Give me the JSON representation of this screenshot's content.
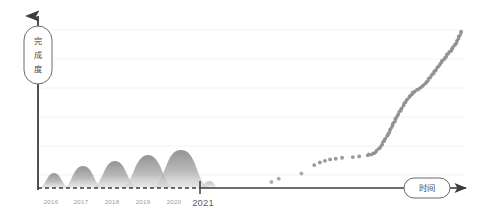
{
  "figure": {
    "background_color": "#ffffff",
    "axis_color": "#3d3d3d",
    "grid_color": "#f2f2f2",
    "hill_color": "#9a9a9a",
    "dot_color": "#8f8f8f",
    "tick_label_color": "#9b9b9b",
    "emph_label_color": "#5e5e5e"
  },
  "axes": {
    "y_axis_label": "完成度",
    "x_axis_label": "时间",
    "x_tick_labels": [
      "2016",
      "2017",
      "2018",
      "2019",
      "2020",
      "2021"
    ],
    "emphasized_tick": "2021",
    "y_tick_labels": [],
    "grid": "horizontal-faint",
    "legend": "none"
  },
  "chart_data": {
    "type": "scatter",
    "title": "",
    "xlabel": "时间",
    "ylabel": "完成度",
    "grid": true,
    "legend_position": "none",
    "xlim": [
      2015.6,
      2025.5
    ],
    "ylim": [
      0,
      1
    ],
    "x_tick_values": [
      2016,
      2017,
      2018,
      2019,
      2020,
      2021
    ],
    "x_tick_labels": [
      "2016",
      "2017",
      "2018",
      "2019",
      "2020",
      "2021"
    ],
    "series": [
      {
        "name": "年度周期峰 (hills)",
        "type": "area",
        "note": "five recurring annual bumps of increasing amplitude before 2021",
        "peaks_x": [
          2016.0,
          2016.95,
          2017.95,
          2018.95,
          2019.95
        ],
        "peaks_height_px": [
          12,
          18,
          23,
          30,
          36
        ],
        "baseline": "dashed"
      },
      {
        "name": "完成度进度点 (dots)",
        "type": "scatter",
        "note": "sparse dots just after 2021 becoming a dense rising trail",
        "points": [
          [
            2021.05,
            0.035
          ],
          [
            2021.22,
            0.055
          ],
          [
            2021.75,
            0.085
          ],
          [
            2022.05,
            0.135
          ],
          [
            2022.18,
            0.15
          ],
          [
            2022.3,
            0.16
          ],
          [
            2022.42,
            0.168
          ],
          [
            2022.55,
            0.172
          ],
          [
            2022.7,
            0.178
          ],
          [
            2022.95,
            0.182
          ],
          [
            2023.1,
            0.186
          ],
          [
            2023.3,
            0.192
          ],
          [
            2023.45,
            0.205
          ],
          [
            2023.58,
            0.235
          ],
          [
            2023.68,
            0.275
          ],
          [
            2023.78,
            0.32
          ],
          [
            2023.88,
            0.37
          ],
          [
            2023.98,
            0.42
          ],
          [
            2024.08,
            0.465
          ],
          [
            2024.18,
            0.505
          ],
          [
            2024.28,
            0.54
          ],
          [
            2024.38,
            0.565
          ],
          [
            2024.48,
            0.58
          ],
          [
            2024.58,
            0.6
          ],
          [
            2024.68,
            0.625
          ],
          [
            2024.78,
            0.66
          ],
          [
            2024.88,
            0.69
          ],
          [
            2024.95,
            0.715
          ],
          [
            2025.02,
            0.74
          ],
          [
            2025.1,
            0.765
          ],
          [
            2025.18,
            0.79
          ],
          [
            2025.26,
            0.815
          ],
          [
            2025.34,
            0.845
          ],
          [
            2025.42,
            0.88
          ],
          [
            2025.48,
            0.92
          ]
        ]
      }
    ]
  }
}
